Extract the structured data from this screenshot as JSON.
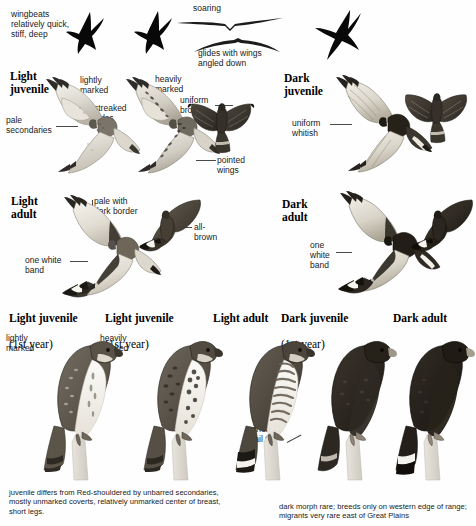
{
  "plate": {
    "title_species": "Broad-winged Hawk",
    "background": "#fefefe",
    "ink": "#1a1a1a"
  },
  "flight_behavior": {
    "wingbeats_label": "wingbeats\nrelatively quick,\nstiff, deep",
    "soaring_label": "soaring",
    "glide_label": "glides with wings\nangled down"
  },
  "rows": [
    {
      "key": "light-juvenile-flight",
      "heading": "Light\njuvenile",
      "annotations": [
        {
          "key": "pale-secondaries",
          "text": "pale\nsecondaries"
        },
        {
          "key": "lightly-marked",
          "text": "lightly\nmarked"
        },
        {
          "key": "streaked-sides",
          "text": "streaked\nsides"
        },
        {
          "key": "heavily-marked",
          "text": "heavily\nmarked"
        },
        {
          "key": "uniform-brown",
          "text": "uniform\nbrown"
        },
        {
          "key": "pointed-wings",
          "text": "pointed\nwings"
        }
      ],
      "heading_right": "Dark\njuvenile",
      "annotations_right": [
        {
          "key": "uniform-whitish",
          "text": "uniform\nwhitish"
        }
      ]
    },
    {
      "key": "light-adult-flight",
      "heading": "Light\nadult",
      "annotations": [
        {
          "key": "pale-with-dark-border",
          "text": "pale with\ndark border"
        },
        {
          "key": "all-brown",
          "text": "all-\nbrown"
        },
        {
          "key": "one-white-band-left",
          "text": "one white\nband"
        }
      ],
      "heading_right": "Dark\nadult",
      "annotations_right": [
        {
          "key": "one-white-band-right",
          "text": "one\nwhite\nband"
        }
      ]
    }
  ],
  "perched": {
    "columns": [
      {
        "key": "perched-light-juvenile-lightly",
        "title": "Light juvenile",
        "subtitle": "(1st year)",
        "note": "lightly\nmarked"
      },
      {
        "key": "perched-light-juvenile-heavily",
        "title": "Light juvenile",
        "subtitle": "(1st year)",
        "note": "heavily\nmarked"
      },
      {
        "key": "perched-light-adult",
        "title": "Light adult",
        "subtitle": "",
        "note": ""
      },
      {
        "key": "perched-dark-juvenile",
        "title": "Dark juvenile",
        "subtitle": "(1st year)",
        "note": ""
      },
      {
        "key": "perched-dark-adult",
        "title": "Dark adult",
        "subtitle": "",
        "note": ""
      }
    ],
    "wingtip_note": "wingtips\nshort of\ntail tip"
  },
  "captions": {
    "left": "juvenile differs from Red-shouldered by unbarred secondaries, mostly unmarked coverts, relatively unmarked center of breast, short legs.",
    "right": "dark morph rare; breeds only on western edge of range; migrants very rare east of Great Plains"
  }
}
